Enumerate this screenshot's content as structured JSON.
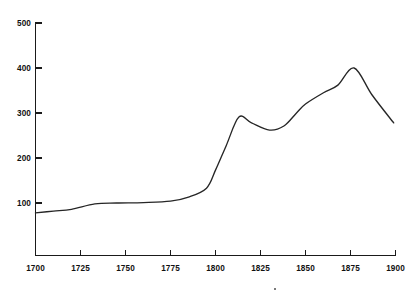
{
  "chart_data": {
    "type": "line",
    "title": "",
    "subtitle": "",
    "xlabel": "",
    "ylabel": "",
    "xlim": [
      1700,
      1900
    ],
    "ylim": [
      0,
      500
    ],
    "grid": false,
    "legend": null,
    "x_ticks": [
      1700,
      1725,
      1750,
      1775,
      1800,
      1825,
      1850,
      1875,
      1900
    ],
    "x_tick_labels": [
      "1700",
      "1725",
      "1750",
      "1775",
      "1800",
      "1825",
      "1850",
      "1875",
      "1900"
    ],
    "y_ticks": [
      100,
      200,
      300,
      400,
      500
    ],
    "y_tick_labels": [
      "100",
      "200",
      "300",
      "400",
      "500"
    ],
    "series": [
      {
        "name": "series-1",
        "color": "#262626",
        "x": [
          1700,
          1710,
          1720,
          1733,
          1745,
          1760,
          1775,
          1785,
          1795,
          1800,
          1806,
          1813,
          1820,
          1830,
          1838,
          1845,
          1850,
          1860,
          1868,
          1877,
          1887,
          1899
        ],
        "y": [
          78,
          82,
          86,
          98,
          100,
          101,
          104,
          113,
          133,
          173,
          228,
          291,
          278,
          262,
          271,
          300,
          320,
          345,
          362,
          400,
          340,
          278
        ]
      }
    ]
  },
  "axes": {
    "y_axis_name": "y-axis",
    "x_axis_name": "x-axis",
    "axis_color": "#1a1a1a"
  }
}
